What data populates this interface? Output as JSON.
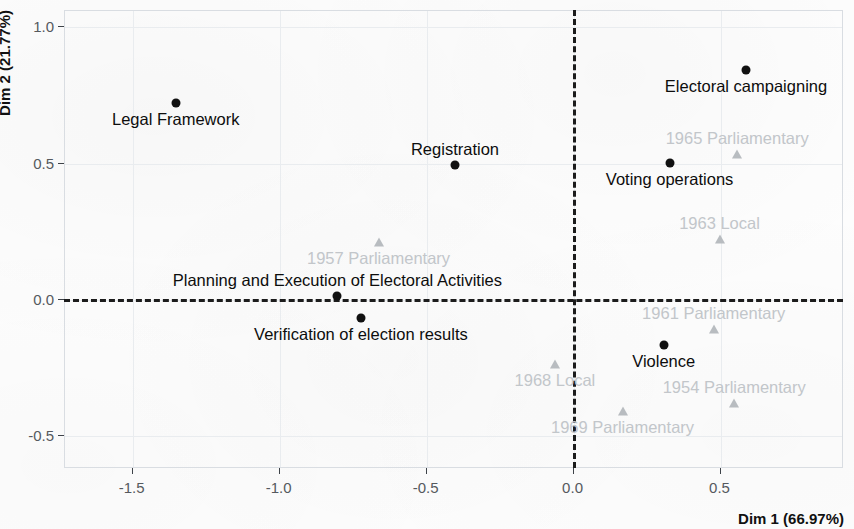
{
  "chart_data": {
    "type": "scatter",
    "title": "",
    "subtitle": "",
    "xlabel": "Dim 1 (66.97%)",
    "ylabel": "Dim 2 (21.77%)",
    "xlim": [
      -1.73,
      0.92
    ],
    "ylim": [
      -0.62,
      1.06
    ],
    "xticks": [
      -1.5,
      -1.0,
      -0.5,
      0.0,
      0.5
    ],
    "xticklabels": [
      "-1.5",
      "-1.0",
      "-0.5",
      "0.0",
      "0.5"
    ],
    "yticks": [
      -0.5,
      0.0,
      0.5,
      1.0
    ],
    "yticklabels": [
      "-0.5",
      "0.0",
      "0.5",
      "1.0"
    ],
    "grid": true,
    "legend": "none",
    "reference_lines": {
      "hline": 0.0,
      "vline": 0.0,
      "style": "dashed",
      "color": "#1c1c1c"
    },
    "colors": {
      "active": "#111111",
      "supplementary": "#c2c6ca",
      "grid": "#e9ecef",
      "frame": "#d9dde2"
    },
    "series": [
      {
        "name": "Electoral process categories",
        "marker": "circle",
        "color": "#111111",
        "points": [
          {
            "label": "Legal Framework",
            "x": -1.35,
            "y": 0.72,
            "label_pos": "below-center"
          },
          {
            "label": "Registration",
            "x": -0.4,
            "y": 0.49,
            "label_pos": "above-center"
          },
          {
            "label": "Electoral campaigning",
            "x": 0.59,
            "y": 0.84,
            "label_pos": "below-center"
          },
          {
            "label": "Voting operations",
            "x": 0.33,
            "y": 0.5,
            "label_pos": "below-center"
          },
          {
            "label": "Planning and Execution of Electoral Activities",
            "x": -0.8,
            "y": 0.01,
            "label_pos": "above-center"
          },
          {
            "label": "Verification of election results",
            "x": -0.72,
            "y": -0.07,
            "label_pos": "below-center"
          },
          {
            "label": "Violence",
            "x": 0.31,
            "y": -0.17,
            "label_pos": "below-center"
          }
        ]
      },
      {
        "name": "Elections",
        "marker": "triangle",
        "color": "#c2c6ca",
        "points": [
          {
            "label": "1957 Parliamentary",
            "x": -0.66,
            "y": 0.21,
            "label_pos": "below-center"
          },
          {
            "label": "1965 Parliamentary",
            "x": 0.56,
            "y": 0.53,
            "label_pos": "above-center"
          },
          {
            "label": "1963 Local",
            "x": 0.5,
            "y": 0.22,
            "label_pos": "above-center"
          },
          {
            "label": "1961 Parliamentary",
            "x": 0.48,
            "y": -0.11,
            "label_pos": "above-center"
          },
          {
            "label": "1968 Local",
            "x": -0.06,
            "y": -0.24,
            "label_pos": "below-center"
          },
          {
            "label": "1954 Parliamentary",
            "x": 0.55,
            "y": -0.38,
            "label_pos": "above-center"
          },
          {
            "label": "1969 Parliamentary",
            "x": 0.17,
            "y": -0.41,
            "label_pos": "below-center"
          }
        ]
      }
    ]
  }
}
